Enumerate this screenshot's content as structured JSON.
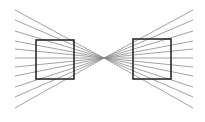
{
  "diagram": {
    "title": "",
    "type": "hering-illusion-squares",
    "background": "#ffffff",
    "line_color": "#8a8a8a",
    "square_color": "#2a2a2a",
    "vanishing_point": [
      104,
      58
    ],
    "left_ray_x": 15,
    "right_ray_x": 193,
    "left_ray_y": [
      10,
      20,
      31,
      41,
      49,
      58,
      67,
      76,
      87,
      97,
      108
    ],
    "right_ray_y": [
      10,
      20,
      31,
      41,
      49,
      58,
      67,
      76,
      87,
      97,
      108
    ],
    "squares": [
      {
        "name": "left-square",
        "x": 36,
        "y": 40,
        "w": 38,
        "h": 39
      },
      {
        "name": "right-square",
        "x": 133,
        "y": 39,
        "w": 38,
        "h": 40
      }
    ]
  }
}
